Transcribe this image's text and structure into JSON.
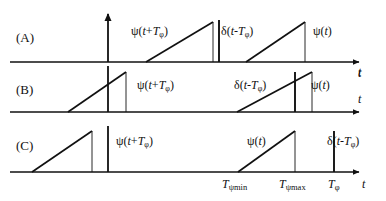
{
  "figure": {
    "width": 386,
    "height": 201,
    "background": "#ffffff",
    "stroke_color": "#111111",
    "rows": [
      {
        "id": "A",
        "row_label": "(A)",
        "baseline_y": 62,
        "axis_t_label": "t",
        "has_vertical_axis": true,
        "signal_labels": [
          {
            "name": "psi-advanced",
            "html": "ψ(<i class=\"it\">t</i>+<i class=\"it\">T</i><sub>φ</sub>)"
          },
          {
            "name": "delta-impulse",
            "html": "δ(<i class=\"it\">t</i>-<i class=\"it\">T</i><sub>φ</sub>)"
          },
          {
            "name": "psi-current",
            "html": "ψ(<i class=\"it\">t</i>)"
          }
        ]
      },
      {
        "id": "B",
        "row_label": "(B)",
        "baseline_y": 112,
        "axis_t_label": "t",
        "has_vertical_axis": true,
        "signal_labels": [
          {
            "name": "psi-advanced",
            "html": "ψ(<i class=\"it\">t</i>+<i class=\"it\">T</i><sub>φ</sub>)"
          },
          {
            "name": "delta-impulse",
            "html": "δ(<i class=\"it\">t</i>-<i class=\"it\">T</i><sub>φ</sub>)"
          },
          {
            "name": "psi-current",
            "html": "ψ(<i class=\"it\">t</i>)"
          }
        ]
      },
      {
        "id": "C",
        "row_label": "(C)",
        "baseline_y": 172,
        "axis_t_label": "t",
        "has_vertical_axis": true,
        "signal_labels": [
          {
            "name": "psi-advanced",
            "html": "ψ(<i class=\"it\">t</i>+<i class=\"it\">T</i><sub>φ</sub>)"
          },
          {
            "name": "psi-current",
            "html": "ψ(<i class=\"it\">t</i>)"
          },
          {
            "name": "delta-impulse",
            "html": "δ(<i class=\"it\">t</i>-<i class=\"it\">T</i><sub>φ</sub>)"
          }
        ]
      }
    ],
    "axis_ticks": [
      {
        "name": "t-psi-min",
        "html": "<i class=\"it\">T</i><sub>ψmin</sub>",
        "x": 238
      },
      {
        "name": "t-psi-max",
        "html": "<i class=\"it\">T</i><sub>ψmax</sub>",
        "x": 295
      },
      {
        "name": "t-phi",
        "html": "<i class=\"it\">T</i><sub>φ</sub>",
        "x": 334
      }
    ],
    "row_labels_text": {
      "a": "(A)",
      "b": "(B)",
      "c": "(C)"
    },
    "text_positions": {
      "row_a_label": {
        "x": 16,
        "y": 30
      },
      "row_b_label": {
        "x": 16,
        "y": 82
      },
      "row_c_label": {
        "x": 16,
        "y": 138
      },
      "a_psi_adv": {
        "x": 131,
        "y": 24
      },
      "a_delta": {
        "x": 221,
        "y": 24
      },
      "a_psi_cur": {
        "x": 313,
        "y": 24
      },
      "b_psi_adv": {
        "x": 137,
        "y": 78
      },
      "b_delta": {
        "x": 234,
        "y": 78
      },
      "b_psi_cur": {
        "x": 311,
        "y": 78
      },
      "c_psi_adv": {
        "x": 116,
        "y": 134
      },
      "c_psi_cur": {
        "x": 247,
        "y": 134
      },
      "c_delta": {
        "x": 327,
        "y": 134
      },
      "a_t": {
        "x": 358,
        "y": 65
      },
      "b_t_upper": {
        "x": 358,
        "y": 66
      },
      "b_t_lower": {
        "x": 358,
        "y": 92
      },
      "c_t": {
        "x": 362,
        "y": 177
      },
      "tick_min": {
        "x": 222,
        "y": 177
      },
      "tick_max": {
        "x": 279,
        "y": 177
      },
      "tick_phi": {
        "x": 328,
        "y": 177
      }
    }
  },
  "chart_data": {
    "type": "line",
    "title": "",
    "xlabel": "t",
    "ylabel": "",
    "vertical_axis_x": 108,
    "axis_arrow_tip_x": 366,
    "axis_left_x": 10,
    "series": [
      {
        "name": "A",
        "baseline_y": 62,
        "vertical_axis": {
          "x": 108,
          "y_top": 14,
          "y_bottom": 62
        },
        "ramps": [
          {
            "name": "psi-advanced",
            "x_start": 146,
            "x_peak": 213,
            "peak_y": 22
          },
          {
            "name": "psi-current",
            "x_start": 246,
            "x_peak": 305,
            "peak_y": 22
          }
        ],
        "impulses": [
          {
            "name": "delta-impulse",
            "x": 219,
            "y_top": 20,
            "weight": "thick"
          }
        ],
        "drop_lines": [
          {
            "x": 213,
            "y_top": 22,
            "weight": "thin"
          },
          {
            "x": 305,
            "y_top": 22,
            "weight": "thin"
          }
        ]
      },
      {
        "name": "B",
        "baseline_y": 112,
        "vertical_axis": {
          "x": 108,
          "y_top": 66,
          "y_bottom": 112
        },
        "ramps": [
          {
            "name": "psi-advanced",
            "x_start": 68,
            "x_peak": 126,
            "peak_y": 72
          },
          {
            "name": "psi-current",
            "x_start": 237,
            "x_peak": 312,
            "peak_y": 72
          }
        ],
        "impulses": [
          {
            "name": "delta-impulse",
            "x": 295,
            "y_top": 72,
            "weight": "thick"
          }
        ],
        "drop_lines": [
          {
            "x": 126,
            "y_top": 72,
            "weight": "thin"
          },
          {
            "x": 312,
            "y_top": 72,
            "weight": "thin"
          }
        ]
      },
      {
        "name": "C",
        "baseline_y": 172,
        "vertical_axis": {
          "x": 108,
          "y_top": 126,
          "y_bottom": 172
        },
        "ramps": [
          {
            "name": "psi-advanced",
            "x_start": 32,
            "x_peak": 92,
            "peak_y": 131
          },
          {
            "name": "psi-current",
            "x_start": 238,
            "x_peak": 295,
            "peak_y": 131
          }
        ],
        "impulses": [
          {
            "name": "delta-impulse",
            "x": 334,
            "y_top": 131,
            "weight": "thick"
          }
        ],
        "drop_lines": [
          {
            "x": 92,
            "y_top": 131,
            "weight": "thin"
          },
          {
            "x": 295,
            "y_top": 131,
            "weight": "thin"
          }
        ]
      }
    ]
  }
}
